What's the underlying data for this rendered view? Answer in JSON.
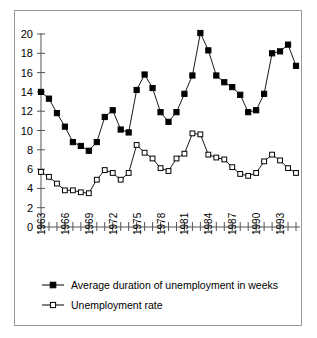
{
  "chart_data": {
    "type": "line",
    "title": "",
    "xlabel": "",
    "ylabel": "",
    "ylim": [
      0,
      20
    ],
    "ytick_step": 2,
    "yticks": [
      0,
      2,
      4,
      6,
      8,
      10,
      12,
      14,
      16,
      18,
      20
    ],
    "xticks_labeled": [
      1963,
      1966,
      1969,
      1972,
      1975,
      1978,
      1981,
      1984,
      1987,
      1990,
      1993
    ],
    "grid": false,
    "legend_position": "below-plot",
    "x": [
      1963,
      1964,
      1965,
      1966,
      1967,
      1968,
      1969,
      1970,
      1971,
      1972,
      1973,
      1974,
      1975,
      1976,
      1977,
      1978,
      1979,
      1980,
      1981,
      1982,
      1983,
      1984,
      1985,
      1986,
      1987,
      1988,
      1989,
      1990,
      1991,
      1992,
      1993,
      1994,
      1995
    ],
    "series": [
      {
        "name": "Average duration of unemployment in weeks",
        "marker": "filled-square",
        "color": "#000000",
        "values": [
          14.0,
          13.3,
          11.8,
          10.4,
          8.8,
          8.4,
          7.9,
          8.8,
          11.4,
          12.1,
          10.1,
          9.8,
          14.2,
          15.8,
          14.4,
          11.9,
          10.9,
          11.9,
          13.8,
          15.7,
          20.1,
          18.3,
          15.7,
          15.0,
          14.5,
          13.7,
          11.9,
          12.1,
          13.8,
          18.0,
          18.2,
          18.9,
          16.7
        ]
      },
      {
        "name": "Unemployment rate",
        "marker": "open-square",
        "color": "#000000",
        "values": [
          5.7,
          5.2,
          4.5,
          3.8,
          3.8,
          3.6,
          3.5,
          4.9,
          5.9,
          5.6,
          4.9,
          5.6,
          8.5,
          7.7,
          7.1,
          6.1,
          5.8,
          7.1,
          7.6,
          9.7,
          9.6,
          7.5,
          7.2,
          7.0,
          6.2,
          5.5,
          5.3,
          5.6,
          6.8,
          7.5,
          6.9,
          6.1,
          5.6
        ]
      }
    ]
  },
  "legend": {
    "items": [
      {
        "label": "Average duration of unemployment in weeks",
        "marker": "filled-square"
      },
      {
        "label": "Unemployment rate",
        "marker": "open-square"
      }
    ]
  }
}
